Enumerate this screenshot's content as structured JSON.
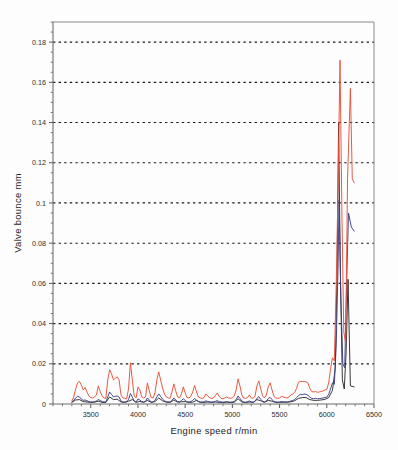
{
  "figure": {
    "background_color": "#fdfdfd",
    "plot_frame_color": "#8a8a8a"
  },
  "axis_titles": {
    "x": "Engine speed  r/min",
    "y": "Valve bounce   mm"
  },
  "chart_data": {
    "type": "line",
    "title": "",
    "xlabel": "Engine speed  r/min",
    "ylabel": "Valve bounce   mm",
    "xlim": [
      3100,
      6500
    ],
    "ylim": [
      0,
      0.19
    ],
    "grid": true,
    "grid_axis": "y",
    "legend": "none",
    "xticks": [
      3500,
      4000,
      4500,
      5000,
      5500,
      6000,
      6500
    ],
    "xticklabels": [
      "3500",
      "4000",
      "4500",
      "5000",
      "5500",
      "6000",
      "6500"
    ],
    "yticks": [
      0,
      0.02,
      0.04,
      0.06,
      0.08,
      0.1,
      0.12,
      0.14,
      0.16,
      0.18
    ],
    "yticklabels": [
      "0",
      "0.02",
      "0.04",
      "0.06",
      "0.08",
      "0.1",
      "0.12",
      "0.14",
      "0.16",
      "0.18"
    ],
    "x_minor_tick_step": 100,
    "y_minor_tick_step": 0.005,
    "series": [
      {
        "name": "valve-bounce-red",
        "color": "#e8513a",
        "peak_value": 0.171,
        "peak_x": 6140,
        "second_peak_value": 0.157,
        "second_peak_x": 6250,
        "x": [
          3300,
          3320,
          3340,
          3360,
          3380,
          3400,
          3420,
          3440,
          3460,
          3480,
          3500,
          3520,
          3540,
          3560,
          3580,
          3600,
          3620,
          3640,
          3660,
          3680,
          3700,
          3720,
          3740,
          3760,
          3780,
          3800,
          3820,
          3840,
          3860,
          3880,
          3900,
          3920,
          3940,
          3960,
          3980,
          4000,
          4020,
          4040,
          4060,
          4080,
          4100,
          4120,
          4140,
          4160,
          4180,
          4200,
          4220,
          4240,
          4260,
          4280,
          4300,
          4320,
          4340,
          4360,
          4380,
          4400,
          4420,
          4440,
          4460,
          4480,
          4500,
          4520,
          4540,
          4560,
          4580,
          4600,
          4620,
          4640,
          4660,
          4680,
          4700,
          4720,
          4740,
          4760,
          4780,
          4800,
          4820,
          4840,
          4860,
          4880,
          4900,
          4920,
          4940,
          4960,
          4980,
          5000,
          5020,
          5040,
          5060,
          5080,
          5100,
          5120,
          5140,
          5160,
          5180,
          5200,
          5220,
          5240,
          5260,
          5280,
          5300,
          5320,
          5340,
          5360,
          5380,
          5400,
          5420,
          5440,
          5460,
          5480,
          5500,
          5520,
          5540,
          5560,
          5580,
          5600,
          5620,
          5640,
          5660,
          5680,
          5700,
          5720,
          5740,
          5760,
          5780,
          5800,
          5820,
          5840,
          5860,
          5880,
          5900,
          5920,
          5940,
          5960,
          5980,
          6000,
          6020,
          6040,
          6060,
          6080,
          6100,
          6120,
          6140,
          6160,
          6180,
          6200,
          6220,
          6250,
          6270,
          6290
        ],
        "values": [
          0.0015,
          0.0035,
          0.0075,
          0.0105,
          0.0112,
          0.0095,
          0.007,
          0.0082,
          0.006,
          0.004,
          0.0032,
          0.003,
          0.0035,
          0.0045,
          0.009,
          0.0062,
          0.004,
          0.003,
          0.0028,
          0.012,
          0.017,
          0.015,
          0.012,
          0.0128,
          0.0135,
          0.012,
          0.0045,
          0.003,
          0.0028,
          0.0025,
          0.0075,
          0.0205,
          0.012,
          0.004,
          0.003,
          0.0085,
          0.007,
          0.0035,
          0.003,
          0.0035,
          0.0105,
          0.0065,
          0.0032,
          0.003,
          0.0055,
          0.012,
          0.016,
          0.012,
          0.008,
          0.005,
          0.0035,
          0.003,
          0.0028,
          0.006,
          0.01,
          0.0065,
          0.0035,
          0.003,
          0.005,
          0.0085,
          0.0055,
          0.0032,
          0.003,
          0.0038,
          0.006,
          0.0092,
          0.006,
          0.0035,
          0.003,
          0.0028,
          0.0032,
          0.005,
          0.004,
          0.003,
          0.0028,
          0.003,
          0.0042,
          0.0055,
          0.0038,
          0.0028,
          0.0026,
          0.003,
          0.0035,
          0.003,
          0.0028,
          0.003,
          0.004,
          0.007,
          0.0125,
          0.009,
          0.0045,
          0.003,
          0.0028,
          0.0032,
          0.0045,
          0.003,
          0.0028,
          0.004,
          0.009,
          0.0115,
          0.0075,
          0.004,
          0.003,
          0.0045,
          0.0085,
          0.0105,
          0.007,
          0.0038,
          0.003,
          0.0028,
          0.003,
          0.0038,
          0.0035,
          0.0032,
          0.003,
          0.0035,
          0.0045,
          0.005,
          0.0058,
          0.0078,
          0.0108,
          0.0112,
          0.0112,
          0.0112,
          0.011,
          0.0105,
          0.0078,
          0.0062,
          0.006,
          0.0062,
          0.0058,
          0.006,
          0.0062,
          0.0065,
          0.007,
          0.0072,
          0.0105,
          0.0175,
          0.023,
          0.0215,
          0.06,
          0.11,
          0.171,
          0.095,
          0.036,
          0.03,
          0.112,
          0.157,
          0.112,
          0.11
        ]
      },
      {
        "name": "valve-bounce-blue",
        "color": "#3c3f82",
        "peak_value": 0.1015,
        "peak_x": 6130,
        "second_peak_value": 0.095,
        "second_peak_x": 6230,
        "x": [
          3300,
          3320,
          3340,
          3360,
          3380,
          3400,
          3420,
          3440,
          3460,
          3480,
          3500,
          3520,
          3540,
          3560,
          3580,
          3600,
          3620,
          3640,
          3660,
          3680,
          3700,
          3720,
          3740,
          3760,
          3780,
          3800,
          3820,
          3840,
          3860,
          3880,
          3900,
          3920,
          3940,
          3960,
          3980,
          4000,
          4020,
          4040,
          4060,
          4080,
          4100,
          4120,
          4140,
          4160,
          4180,
          4200,
          4220,
          4240,
          4260,
          4280,
          4300,
          4320,
          4340,
          4360,
          4380,
          4400,
          4420,
          4440,
          4460,
          4480,
          4500,
          4520,
          4540,
          4560,
          4580,
          4600,
          4620,
          4640,
          4660,
          4680,
          4700,
          4720,
          4740,
          4760,
          4780,
          4800,
          4820,
          4840,
          4860,
          4880,
          4900,
          4920,
          4940,
          4960,
          4980,
          5000,
          5020,
          5040,
          5060,
          5080,
          5100,
          5120,
          5140,
          5160,
          5180,
          5200,
          5220,
          5240,
          5260,
          5280,
          5300,
          5320,
          5340,
          5360,
          5380,
          5400,
          5420,
          5440,
          5460,
          5480,
          5500,
          5520,
          5540,
          5560,
          5580,
          5600,
          5620,
          5640,
          5660,
          5680,
          5700,
          5720,
          5740,
          5760,
          5780,
          5800,
          5820,
          5840,
          5860,
          5880,
          5900,
          5920,
          5940,
          5960,
          5980,
          6000,
          6020,
          6040,
          6060,
          6080,
          6100,
          6120,
          6130,
          6150,
          6170,
          6190,
          6210,
          6230,
          6260,
          6290
        ],
        "values": [
          0.001,
          0.0018,
          0.003,
          0.0038,
          0.0035,
          0.0025,
          0.0018,
          0.002,
          0.0016,
          0.0012,
          0.001,
          0.001,
          0.0012,
          0.0015,
          0.0022,
          0.0018,
          0.0012,
          0.001,
          0.001,
          0.0035,
          0.006,
          0.0048,
          0.0035,
          0.0038,
          0.004,
          0.0035,
          0.0015,
          0.001,
          0.001,
          0.001,
          0.0022,
          0.0052,
          0.0035,
          0.0014,
          0.001,
          0.0025,
          0.002,
          0.0012,
          0.001,
          0.0012,
          0.003,
          0.002,
          0.001,
          0.001,
          0.0018,
          0.0035,
          0.005,
          0.0038,
          0.0024,
          0.0016,
          0.0012,
          0.001,
          0.001,
          0.0018,
          0.003,
          0.002,
          0.0012,
          0.001,
          0.0016,
          0.0026,
          0.0018,
          0.001,
          0.001,
          0.0012,
          0.0018,
          0.0028,
          0.0018,
          0.0012,
          0.001,
          0.001,
          0.001,
          0.0016,
          0.0012,
          0.001,
          0.001,
          0.001,
          0.0013,
          0.0017,
          0.0012,
          0.001,
          0.0009,
          0.001,
          0.0012,
          0.001,
          0.0009,
          0.001,
          0.0013,
          0.0022,
          0.004,
          0.0028,
          0.0015,
          0.001,
          0.0009,
          0.0011,
          0.0015,
          0.001,
          0.0009,
          0.0013,
          0.0028,
          0.0036,
          0.0024,
          0.0013,
          0.001,
          0.0015,
          0.0027,
          0.0033,
          0.0022,
          0.0012,
          0.001,
          0.0009,
          0.001,
          0.0012,
          0.0011,
          0.001,
          0.001,
          0.0012,
          0.0015,
          0.0018,
          0.0022,
          0.0032,
          0.0042,
          0.0048,
          0.0046,
          0.005,
          0.0048,
          0.0044,
          0.0034,
          0.0028,
          0.0026,
          0.0028,
          0.0026,
          0.0027,
          0.0028,
          0.003,
          0.0032,
          0.0034,
          0.0048,
          0.0075,
          0.0105,
          0.0098,
          0.03,
          0.07,
          0.1015,
          0.052,
          0.02,
          0.018,
          0.06,
          0.095,
          0.088,
          0.086
        ]
      },
      {
        "name": "valve-bounce-black",
        "color": "#171717",
        "peak_value": 0.14,
        "peak_x": 6125,
        "second_peak_value": 0.062,
        "second_peak_x": 6225,
        "x": [
          3300,
          3340,
          3380,
          3420,
          3460,
          3500,
          3540,
          3580,
          3620,
          3660,
          3700,
          3740,
          3780,
          3820,
          3860,
          3900,
          3940,
          3980,
          4020,
          4060,
          4100,
          4140,
          4180,
          4220,
          4260,
          4300,
          4340,
          4380,
          4420,
          4460,
          4500,
          4540,
          4580,
          4620,
          4660,
          4700,
          4740,
          4780,
          4820,
          4860,
          4900,
          4940,
          4980,
          5020,
          5060,
          5100,
          5140,
          5180,
          5220,
          5260,
          5300,
          5340,
          5380,
          5420,
          5460,
          5500,
          5540,
          5580,
          5620,
          5660,
          5700,
          5740,
          5780,
          5820,
          5860,
          5900,
          5940,
          5980,
          6020,
          6060,
          6090,
          6110,
          6125,
          6145,
          6165,
          6185,
          6205,
          6225,
          6250,
          6290
        ],
        "values": [
          0.0008,
          0.002,
          0.0022,
          0.0012,
          0.001,
          0.0008,
          0.0009,
          0.0014,
          0.0008,
          0.0008,
          0.0035,
          0.0022,
          0.0024,
          0.001,
          0.0008,
          0.0014,
          0.0022,
          0.0008,
          0.0013,
          0.0008,
          0.0018,
          0.0008,
          0.0012,
          0.003,
          0.0016,
          0.0009,
          0.0008,
          0.002,
          0.0009,
          0.0011,
          0.0012,
          0.0008,
          0.0009,
          0.0018,
          0.0008,
          0.0008,
          0.001,
          0.0008,
          0.001,
          0.0008,
          0.0007,
          0.0009,
          0.0007,
          0.0009,
          0.0026,
          0.001,
          0.0007,
          0.001,
          0.0008,
          0.0022,
          0.0016,
          0.0008,
          0.0018,
          0.0014,
          0.0008,
          0.0008,
          0.0009,
          0.0009,
          0.0011,
          0.0016,
          0.0028,
          0.0032,
          0.0032,
          0.0022,
          0.0018,
          0.0018,
          0.002,
          0.0023,
          0.0032,
          0.0068,
          0.018,
          0.07,
          0.14,
          0.06,
          0.012,
          0.0075,
          0.026,
          0.062,
          0.009,
          0.0085
        ]
      }
    ]
  }
}
